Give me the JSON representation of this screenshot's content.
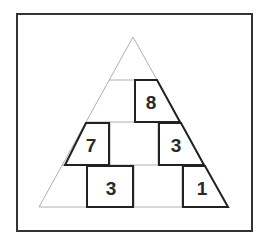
{
  "puzzle": {
    "type": "number-pyramid",
    "rows": 4,
    "cells": [
      {
        "row": 1,
        "col": 1,
        "value": ""
      },
      {
        "row": 2,
        "col": 1,
        "value": ""
      },
      {
        "row": 2,
        "col": 2,
        "value": "8"
      },
      {
        "row": 3,
        "col": 1,
        "value": "7"
      },
      {
        "row": 3,
        "col": 2,
        "value": ""
      },
      {
        "row": 3,
        "col": 3,
        "value": "3"
      },
      {
        "row": 4,
        "col": 1,
        "value": ""
      },
      {
        "row": 4,
        "col": 2,
        "value": "3"
      },
      {
        "row": 4,
        "col": 3,
        "value": ""
      },
      {
        "row": 4,
        "col": 4,
        "value": "1"
      }
    ],
    "given": {
      "r2c2": "8",
      "r3c1": "7",
      "r3c3": "3",
      "r4c2": "3",
      "r4c4": "1"
    }
  },
  "colors": {
    "frame": "#333333",
    "thin_line": "#b0b0b0",
    "box": "#222222",
    "text": "#2a2a2a"
  }
}
